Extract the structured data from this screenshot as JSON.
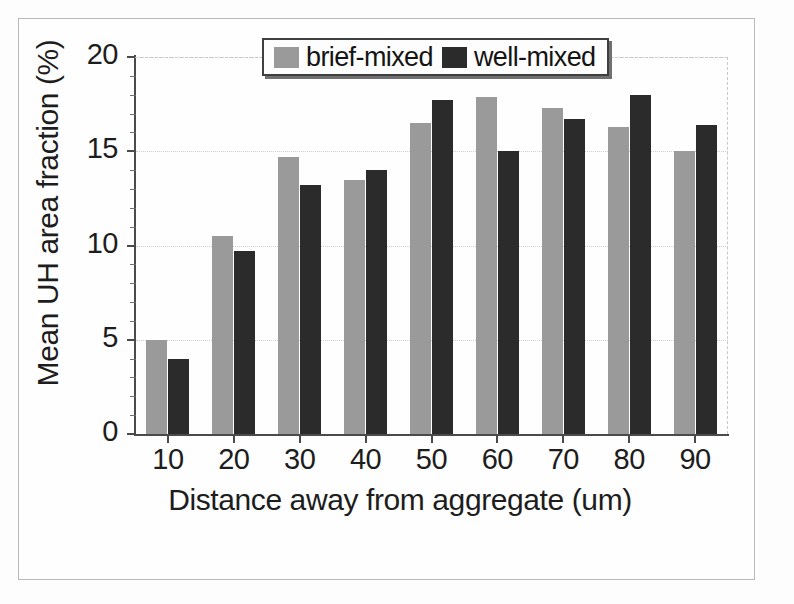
{
  "chart_data": {
    "type": "bar",
    "title": "",
    "xlabel": "Distance away from aggregate (um)",
    "ylabel": "Mean UH area fraction (%)",
    "categories": [
      "10",
      "20",
      "30",
      "40",
      "50",
      "60",
      "70",
      "80",
      "90"
    ],
    "series": [
      {
        "name": "brief-mixed",
        "color": "#9a9a9a",
        "values": [
          5.0,
          10.5,
          14.7,
          13.5,
          16.5,
          17.9,
          17.3,
          16.3,
          15.0
        ]
      },
      {
        "name": "well-mixed",
        "color": "#2b2b2b",
        "values": [
          4.0,
          9.7,
          13.2,
          14.0,
          17.7,
          15.0,
          16.7,
          18.0,
          16.4
        ]
      }
    ],
    "ylim": [
      0,
      20
    ],
    "yticks": [
      "0",
      "5",
      "10",
      "15",
      "20"
    ],
    "ytick_values": [
      0,
      5,
      10,
      15,
      20
    ],
    "y_minor_interval": 1,
    "grid": "horizontal-dotted",
    "legend_position": "top-center",
    "legend_entries": [
      "brief-mixed",
      "well-mixed"
    ]
  },
  "legend": {
    "entries": [
      {
        "label": "brief-mixed",
        "swatch": "brief"
      },
      {
        "label": "well-mixed",
        "swatch": "well"
      }
    ]
  },
  "colors": {
    "brief_mixed": "#9a9a9a",
    "well_mixed": "#2b2b2b",
    "axis": "#4a4a4a",
    "text": "#1d1d1d",
    "frame": "#b9b9b9"
  }
}
